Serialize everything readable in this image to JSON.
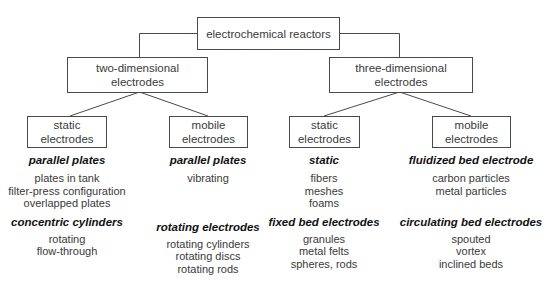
{
  "root": {
    "label": "electrochemical reactors"
  },
  "level1": [
    {
      "id": "two-dimensional",
      "line1": "two-dimensional",
      "line2": "electrodes"
    },
    {
      "id": "three-dimensional",
      "line1": "three-dimensional",
      "line2": "electrodes"
    }
  ],
  "level2": [
    {
      "line1": "static",
      "line2": "electrodes"
    },
    {
      "line1": "mobile",
      "line2": "electrodes"
    },
    {
      "line1": "static",
      "line2": "electrodes"
    },
    {
      "line1": "mobile",
      "line2": "electrodes"
    }
  ],
  "columns": [
    {
      "groups": [
        {
          "heading": "parallel plates",
          "items": [
            "plates in tank",
            "filter-press configuration",
            "overlapped plates"
          ]
        },
        {
          "heading": "concentric cylinders",
          "items": [
            "rotating",
            "flow-through"
          ]
        }
      ]
    },
    {
      "groups": [
        {
          "heading": "parallel plates",
          "items": [
            "vibrating"
          ]
        },
        {
          "heading": "rotating electrodes",
          "items": [
            "rotating cylinders",
            "rotating discs",
            "rotating rods"
          ]
        }
      ]
    },
    {
      "groups": [
        {
          "heading": "static",
          "items": [
            "fibers",
            "meshes",
            "foams"
          ]
        },
        {
          "heading": "fixed bed electrodes",
          "items": [
            "granules",
            "metal felts",
            "spheres, rods"
          ]
        }
      ]
    },
    {
      "groups": [
        {
          "heading": "fluidized bed electrode",
          "items": [
            "carbon particles",
            "metal particles"
          ]
        },
        {
          "heading": "circulating bed electrodes",
          "items": [
            "spouted",
            "vortex",
            "inclined beds"
          ]
        }
      ]
    }
  ],
  "colors": {
    "line": "#4a4a4a",
    "text": "#3a3a3a",
    "heading": "#111111"
  }
}
